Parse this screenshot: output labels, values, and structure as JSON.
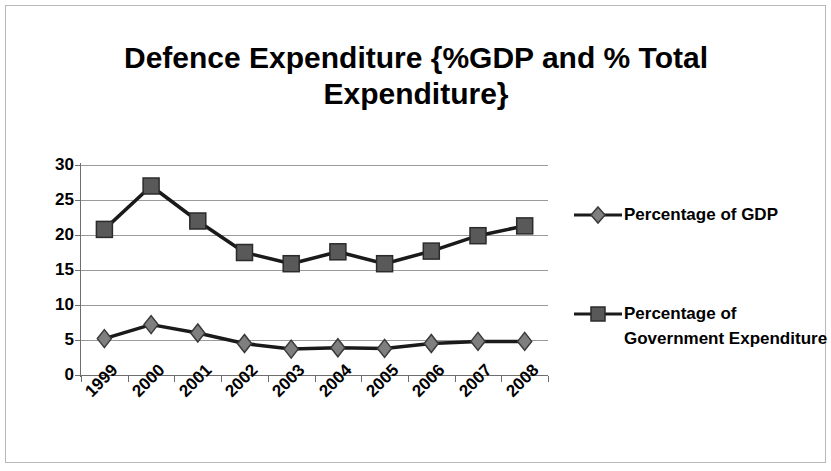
{
  "chart_data": {
    "type": "line",
    "title": "Defence Expenditure {%GDP and % Total Expenditure}",
    "xlabel": "",
    "ylabel": "",
    "categories": [
      "1999",
      "2000",
      "2001",
      "2002",
      "2003",
      "2004",
      "2005",
      "2006",
      "2007",
      "2008"
    ],
    "series": [
      {
        "name": "Percentage of GDP",
        "marker": "diamond",
        "color": "#7f7f7f",
        "line_color": "#1a1a1a",
        "values": [
          5.2,
          7.2,
          6.0,
          4.5,
          3.7,
          3.9,
          3.8,
          4.5,
          4.8,
          4.8
        ]
      },
      {
        "name": "Percentage of Government Expenditure",
        "marker": "square",
        "color": "#595959",
        "line_color": "#1a1a1a",
        "values": [
          20.8,
          27.0,
          22.0,
          17.5,
          15.9,
          17.6,
          15.9,
          17.7,
          19.9,
          21.3
        ]
      }
    ],
    "ylim": [
      0,
      30
    ],
    "yticks": [
      0,
      5,
      10,
      15,
      20,
      25,
      30
    ],
    "ytick_labels": [
      "0",
      "5",
      "10",
      "15",
      "20",
      "25",
      "30"
    ],
    "grid": true,
    "legend_position": "right",
    "legend_entries": [
      "Percentage of GDP",
      "Percentage of Government Expenditure"
    ]
  },
  "colors": {
    "grid": "#9a9a9a",
    "axis": "#6e6e6e",
    "frame_border": "#b9b9b9",
    "text": "#000000",
    "background": "#ffffff"
  }
}
